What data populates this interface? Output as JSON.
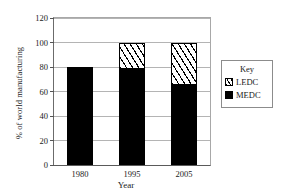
{
  "chart_data": {
    "type": "bar",
    "subtype": "stacked-bar",
    "title": "",
    "xlabel": "Year",
    "ylabel": "% of world manufacturing",
    "categories": [
      "1980",
      "1995",
      "2005"
    ],
    "series": [
      {
        "name": "MEDC",
        "values": [
          80,
          78,
          65
        ],
        "fill": "solid-black",
        "color": "#000000"
      },
      {
        "name": "LEDC",
        "values": [
          0,
          22,
          35
        ],
        "fill": "diagonal-hatch",
        "color": "#ffffff"
      }
    ],
    "stack_totals": [
      80,
      100,
      100
    ],
    "ylim": [
      0,
      120
    ],
    "yticks": [
      0,
      20,
      40,
      60,
      80,
      100,
      120
    ],
    "ytick_labels": [
      "0",
      "20",
      "40",
      "60",
      "80",
      "100",
      "120"
    ],
    "grid": true,
    "grid_axis": "y",
    "legend": {
      "position": "right-outside",
      "title": "Key",
      "entries": [
        {
          "label": "LEDC",
          "swatch": "diagonal-hatch"
        },
        {
          "label": "MEDC",
          "swatch": "solid-black"
        }
      ]
    }
  },
  "axes": {
    "y_title": "% of world manufacturing",
    "x_title": "Year",
    "y_ticks": [
      {
        "label": "120",
        "value": 120
      },
      {
        "label": "100",
        "value": 100
      },
      {
        "label": "80",
        "value": 80
      },
      {
        "label": "60",
        "value": 60
      },
      {
        "label": "40",
        "value": 40
      },
      {
        "label": "20",
        "value": 20
      },
      {
        "label": "0",
        "value": 0
      }
    ],
    "x_ticks": [
      {
        "label": "1980"
      },
      {
        "label": "1995"
      },
      {
        "label": "2005"
      }
    ]
  },
  "bars": [
    {
      "category": "1980",
      "medc": 80,
      "ledc": 0,
      "total": 80
    },
    {
      "category": "1995",
      "medc": 78,
      "ledc": 22,
      "total": 100
    },
    {
      "category": "2005",
      "medc": 65,
      "ledc": 35,
      "total": 100
    }
  ],
  "legend": {
    "title": "Key",
    "ledc_label": "LEDC",
    "medc_label": "MEDC"
  },
  "colors": {
    "medc": "#000000",
    "ledc": "#ffffff",
    "grid": "#b4b4b4",
    "axis": "#555555",
    "text": "#1a1a1a"
  }
}
